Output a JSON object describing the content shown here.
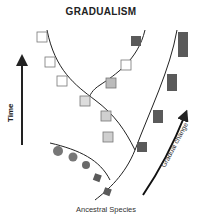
{
  "title": "GRADUALISM",
  "axis": {
    "time_label": "Time"
  },
  "annotations": {
    "gradual_change": "Gradual change",
    "ancestral_species": "Ancestral Species"
  },
  "colors": {
    "line": "#222222",
    "dark": "#5a5a5a",
    "mid": "#8a8a8a",
    "light": "#cfcfcf",
    "white": "#ffffff"
  }
}
